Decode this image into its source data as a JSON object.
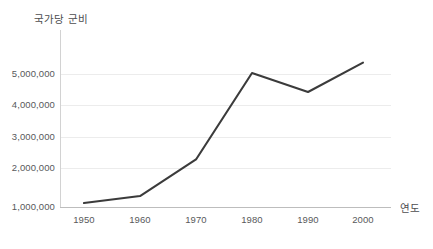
{
  "chart_data": {
    "type": "line",
    "title": "",
    "ylabel": "국가당 군비",
    "xlabel": "연도",
    "categories": [
      1950,
      1960,
      1970,
      1980,
      1990,
      2000
    ],
    "x_tick_labels": [
      "1950",
      "1960",
      "1970",
      "1980",
      "1990",
      "2000"
    ],
    "y_tick_labels": [
      "1,000,000",
      "2,000,000",
      "3,000,000",
      "4,000,000",
      "5,000,000"
    ],
    "y_ticks": [
      1000000,
      2000000,
      3000000,
      4000000,
      5000000
    ],
    "ylim": [
      1000000,
      5350000
    ],
    "xlim": [
      1945,
      2005
    ],
    "grid": true,
    "legend": false,
    "series": [
      {
        "name": "국가당 군비",
        "color": "#3b3b3b",
        "values": [
          1120000,
          1330000,
          2430000,
          5030000,
          4460000,
          5340000
        ]
      }
    ]
  },
  "axes": {
    "y_title": "국가당 군비",
    "x_title": "연도",
    "y_labels": [
      "5,000,000",
      "4,000,000",
      "3,000,000",
      "2,000,000",
      "1,000,000"
    ],
    "x_labels": [
      "1950",
      "1960",
      "1970",
      "1980",
      "1990",
      "2000"
    ]
  },
  "colors": {
    "line": "#3b3b3b",
    "grid": "#ececec",
    "axis": "#c4c4c4",
    "text": "#58595b",
    "background": "#ffffff"
  }
}
